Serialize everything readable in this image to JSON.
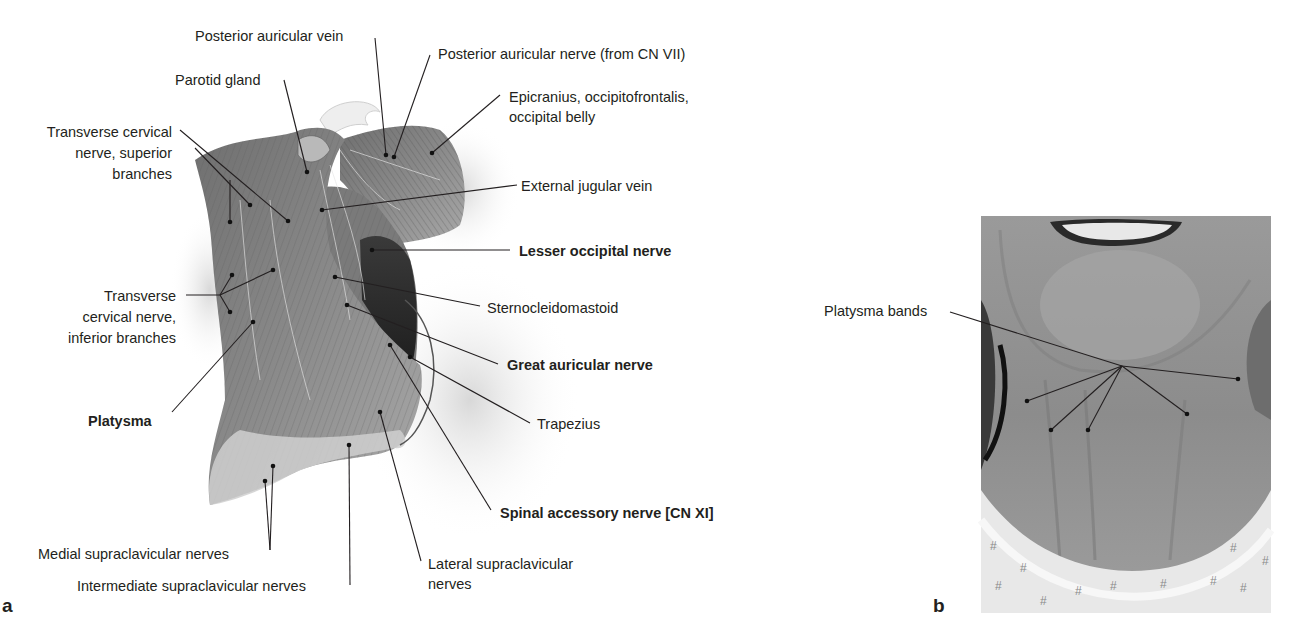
{
  "panel_a": {
    "letter": "a",
    "labels": {
      "posterior_auricular_vein": "Posterior auricular vein",
      "posterior_auricular_nerve": "Posterior auricular nerve (from CN VII)",
      "parotid_gland": "Parotid gland",
      "epicranius_1": "Epicranius, occipitofrontalis,",
      "epicranius_2": "occipital belly",
      "tcn_sup_1": "Transverse cervical",
      "tcn_sup_2": "nerve, superior",
      "tcn_sup_3": "branches",
      "external_jugular_vein": "External jugular vein",
      "lesser_occipital_nerve": "Lesser occipital nerve",
      "tcn_inf_1": "Transverse",
      "tcn_inf_2": "cervical nerve,",
      "tcn_inf_3": "inferior branches",
      "sternocleidomastoid": "Sternocleidomastoid",
      "great_auricular_nerve": "Great auricular nerve",
      "platysma": "Platysma",
      "trapezius": "Trapezius",
      "spinal_accessory_nerve": "Spinal accessory nerve [CN XI]",
      "medial_supraclavicular": "Medial supraclavicular nerves",
      "intermediate_supraclavicular": "Intermediate supraclavicular nerves",
      "lateral_supraclavicular_1": "Lateral supraclavicular",
      "lateral_supraclavicular_2": "nerves"
    }
  },
  "panel_b": {
    "letter": "b",
    "labels": {
      "platysma_bands": "Platysma bands"
    }
  }
}
